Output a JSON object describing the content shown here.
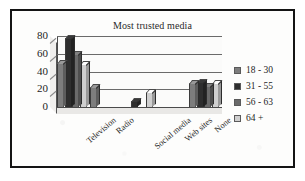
{
  "chart_data": {
    "type": "bar",
    "title": "Most trusted media",
    "xlabel": "",
    "ylabel": "",
    "ylim": [
      0,
      80
    ],
    "yticks": [
      0,
      20,
      40,
      60,
      80
    ],
    "grid": true,
    "legend_position": "right",
    "categories": [
      "Television",
      "Radio",
      "Social media",
      "Web sites",
      "None"
    ],
    "series": [
      {
        "name": "18 - 30",
        "color": "#7d7d7d",
        "values": [
          50,
          22,
          0,
          0,
          27
        ]
      },
      {
        "name": "31 - 55",
        "color": "#2e2e2e",
        "values": [
          78,
          0,
          7,
          0,
          28
        ]
      },
      {
        "name": "56 - 63",
        "color": "#6a6a6a",
        "values": [
          60,
          0,
          0,
          0,
          24
        ]
      },
      {
        "name": "64 +",
        "color": "#cfcfcf",
        "values": [
          48,
          0,
          17,
          0,
          27
        ]
      }
    ]
  },
  "legend": {
    "items": [
      {
        "label": "18 - 30"
      },
      {
        "label": "31 - 55"
      },
      {
        "label": "56 - 63"
      },
      {
        "label": "64 +"
      }
    ]
  }
}
